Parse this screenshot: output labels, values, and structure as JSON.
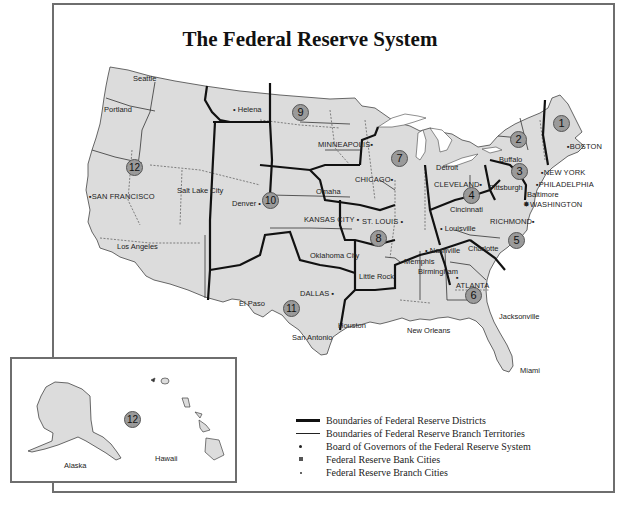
{
  "title": "The Federal Reserve System",
  "colors": {
    "land_fill": "#dcdcdc",
    "district_boundary": "#111111",
    "branch_boundary": "#333333",
    "district_circle_fill": "#9a9a9a",
    "frame": "#6e6e6e"
  },
  "districts": [
    {
      "number": "1",
      "x": 561,
      "y": 123
    },
    {
      "number": "2",
      "x": 518,
      "y": 131
    },
    {
      "number": "3",
      "x": 513,
      "y": 165
    },
    {
      "number": "4",
      "x": 468,
      "y": 188
    },
    {
      "number": "5",
      "x": 512,
      "y": 233
    },
    {
      "number": "6",
      "x": 469,
      "y": 290
    },
    {
      "number": "7",
      "x": 393,
      "y": 151
    },
    {
      "number": "8",
      "x": 373,
      "y": 231
    },
    {
      "number": "9",
      "x": 290,
      "y": 105
    },
    {
      "number": "10",
      "x": 262,
      "y": 193
    },
    {
      "number": "11",
      "x": 283,
      "y": 303
    },
    {
      "number": "12",
      "x": 126,
      "y": 160
    }
  ],
  "bank_cities": [
    {
      "name": "BOSTON",
      "x": 571,
      "y": 142
    },
    {
      "name": "NEW YORK",
      "x": 546,
      "y": 169
    },
    {
      "name": "PHILADELPHIA",
      "x": 542,
      "y": 180
    },
    {
      "name": "CLEVELAND",
      "x": 435,
      "y": 180
    },
    {
      "name": "RICHMOND",
      "x": 490,
      "y": 217
    },
    {
      "name": "ATLANTA",
      "x": 456,
      "y": 278
    },
    {
      "name": "CHICAGO",
      "x": 367,
      "y": 175
    },
    {
      "name": "ST. LOUIS",
      "x": 363,
      "y": 219
    },
    {
      "name": "MINNEAPOLIS",
      "x": 318,
      "y": 141
    },
    {
      "name": "KANSAS CITY",
      "x": 304,
      "y": 217
    },
    {
      "name": "DALLAS",
      "x": 300,
      "y": 290
    },
    {
      "name": "SAN FRANCISCO",
      "x": 93,
      "y": 193
    }
  ],
  "board_city": {
    "name": "WASHINGTON",
    "x": 529,
    "y": 202
  },
  "branch_cities": [
    {
      "name": "Seattle",
      "x": 133,
      "y": 75
    },
    {
      "name": "Portland",
      "x": 103,
      "y": 106
    },
    {
      "name": "Helena",
      "x": 237,
      "y": 107
    },
    {
      "name": "Salt Lake City",
      "x": 178,
      "y": 187
    },
    {
      "name": "Los Angeles",
      "x": 118,
      "y": 244
    },
    {
      "name": "Denver",
      "x": 231,
      "y": 201
    },
    {
      "name": "Omaha",
      "x": 316,
      "y": 189
    },
    {
      "name": "Oklahoma City",
      "x": 309,
      "y": 253
    },
    {
      "name": "Little Rock",
      "x": 362,
      "y": 273
    },
    {
      "name": "El Paso",
      "x": 238,
      "y": 301
    },
    {
      "name": "San Antonio",
      "x": 290,
      "y": 334
    },
    {
      "name": "Houston",
      "x": 340,
      "y": 323
    },
    {
      "name": "New Orleans",
      "x": 406,
      "y": 329
    },
    {
      "name": "Memphis",
      "x": 402,
      "y": 259
    },
    {
      "name": "Nashville",
      "x": 430,
      "y": 248
    },
    {
      "name": "Birmingham",
      "x": 416,
      "y": 269
    },
    {
      "name": "Louisville",
      "x": 446,
      "y": 226
    },
    {
      "name": "Cincinnati",
      "x": 449,
      "y": 207
    },
    {
      "name": "Detroit",
      "x": 436,
      "y": 165
    },
    {
      "name": "Pittsburgh",
      "x": 489,
      "y": 185
    },
    {
      "name": "Buffalo",
      "x": 500,
      "y": 157
    },
    {
      "name": "Baltimore",
      "x": 527,
      "y": 192
    },
    {
      "name": "Charlotte",
      "x": 468,
      "y": 246
    },
    {
      "name": "Jacksonville",
      "x": 499,
      "y": 313
    },
    {
      "name": "Miami",
      "x": 521,
      "y": 368
    }
  ],
  "inset": {
    "district_number": "12",
    "alaska_label": "Alaska",
    "hawaii_label": "Hawaii"
  },
  "legend": [
    {
      "symbol": "thick-line",
      "label": "Boundaries of Federal Reserve Districts"
    },
    {
      "symbol": "thin-line",
      "label": "Boundaries of Federal Reserve Branch Territories"
    },
    {
      "symbol": "star-dot",
      "label": "Board of Governors of the Federal Reserve System"
    },
    {
      "symbol": "square",
      "label": "Federal Reserve Bank Cities"
    },
    {
      "symbol": "dot",
      "label": "Federal Reserve Branch Cities"
    }
  ]
}
